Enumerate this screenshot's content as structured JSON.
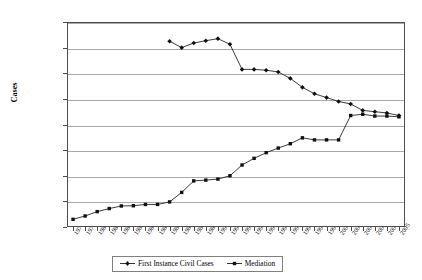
{
  "chart_data": {
    "type": "line",
    "title": "",
    "xlabel": "",
    "ylabel": "Cases",
    "ylim": [
      0,
      8000000
    ],
    "grid": true,
    "legend_position": "bottom",
    "y_ticks": [
      "0",
      "1000000",
      "2000000",
      "3000000",
      "4000000",
      "5000000",
      "6000000",
      "7000000",
      "8000000"
    ],
    "categories": [
      "1978",
      "1979",
      "1980",
      "1981",
      "1982",
      "1983",
      "1984",
      "1985",
      "1986",
      "1987",
      "1988",
      "1989",
      "1990",
      "1991",
      "1992",
      "1993",
      "1994",
      "1995",
      "1996",
      "1997",
      "1998",
      "1999",
      "2000",
      "2001",
      "2002",
      "2003",
      "2004",
      "2005"
    ],
    "series": [
      {
        "name": "First Instance Civil Cases",
        "marker": "diamond",
        "values": [
          null,
          null,
          null,
          null,
          null,
          null,
          null,
          null,
          7250000,
          7000000,
          7180000,
          7270000,
          7350000,
          7130000,
          6150000,
          6150000,
          6120000,
          6050000,
          5800000,
          5450000,
          5200000,
          5050000,
          4900000,
          4800000,
          4550000,
          4500000,
          4450000,
          4350000
        ]
      },
      {
        "name": "Mediation",
        "marker": "square",
        "values": [
          300000,
          430000,
          600000,
          720000,
          820000,
          830000,
          880000,
          880000,
          980000,
          1350000,
          1800000,
          1830000,
          1870000,
          2000000,
          2420000,
          2680000,
          2900000,
          3080000,
          3250000,
          3480000,
          3400000,
          3400000,
          3400000,
          4350000,
          4400000,
          4330000,
          4330000,
          4300000
        ]
      }
    ]
  },
  "legend": {
    "items": [
      {
        "label": "First Instance Civil Cases"
      },
      {
        "label": "Mediation"
      }
    ]
  }
}
